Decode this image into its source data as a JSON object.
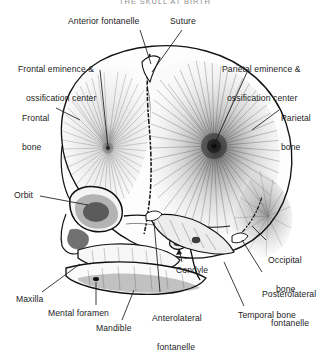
{
  "figure": {
    "header_title": "THE SKULL AT BIRTH",
    "style": "pen-and-ink anatomical engraving",
    "background_color": "#ffffff",
    "ink_color": "#1c1c1c",
    "leader_line_color": "#1c1c1c"
  },
  "labels": [
    {
      "id": "anterior-fontanelle",
      "text": "Anterior fontanelle",
      "lines": [
        "Anterior fontanelle"
      ],
      "x": 68,
      "y": 17,
      "align": "left"
    },
    {
      "id": "suture",
      "text": "Suture",
      "lines": [
        "Suture"
      ],
      "x": 170,
      "y": 17,
      "align": "left"
    },
    {
      "id": "frontal-eminence",
      "text": "Frontal eminence & ossification center",
      "lines": [
        "Frontal eminence &",
        "ossification center"
      ],
      "x": 18,
      "y": 47,
      "align": "left"
    },
    {
      "id": "parietal-eminence",
      "text": "Parietal eminence & ossification center",
      "lines": [
        "Parietal eminence &",
        "ossification center"
      ],
      "x": 222,
      "y": 47,
      "align": "left"
    },
    {
      "id": "frontal-bone",
      "text": "Frontal bone",
      "lines": [
        "Frontal",
        "bone"
      ],
      "x": 22,
      "y": 96,
      "align": "left"
    },
    {
      "id": "parietal-bone",
      "text": "Parietal bone",
      "lines": [
        "Parietal",
        "bone"
      ],
      "x": 281,
      "y": 96,
      "align": "left"
    },
    {
      "id": "orbit",
      "text": "Orbit",
      "lines": [
        "Orbit"
      ],
      "x": 14,
      "y": 192,
      "align": "left"
    },
    {
      "id": "occipital-bone",
      "text": "Occipital bone",
      "lines": [
        "Occipital",
        "bone"
      ],
      "x": 268,
      "y": 238,
      "align": "left"
    },
    {
      "id": "posterolateral-fontanelle",
      "text": "Posterolateral fontanelle",
      "lines": [
        "Posterolateral",
        "fontanelle"
      ],
      "x": 264,
      "y": 272,
      "align": "left"
    },
    {
      "id": "condyle",
      "text": "Condyle",
      "lines": [
        "Condyle"
      ],
      "x": 176,
      "y": 267,
      "align": "left"
    },
    {
      "id": "anterolateral-fontanelle",
      "text": "Anterolateral fontanelle",
      "lines": [
        "Anterolateral",
        "fontanelle"
      ],
      "x": 152,
      "y": 296,
      "align": "left"
    },
    {
      "id": "temporal-bone",
      "text": "Temporal bone",
      "lines": [
        "Temporal bone"
      ],
      "x": 238,
      "y": 312,
      "align": "left"
    },
    {
      "id": "maxilla",
      "text": "Maxilla",
      "lines": [
        "Maxilla"
      ],
      "x": 16,
      "y": 296,
      "align": "left"
    },
    {
      "id": "mental-foramen",
      "text": "Mental foramen",
      "lines": [
        "Mental foramen"
      ],
      "x": 48,
      "y": 310,
      "align": "left"
    },
    {
      "id": "mandible",
      "text": "Mandible",
      "lines": [
        "Mandible"
      ],
      "x": 96,
      "y": 325,
      "align": "left"
    }
  ]
}
